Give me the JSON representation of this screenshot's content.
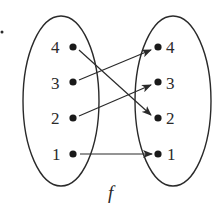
{
  "diagram": {
    "function_name": "f",
    "domain": {
      "elements": [
        {
          "label": "4",
          "x": 73,
          "y": 47
        },
        {
          "label": "3",
          "x": 73,
          "y": 82
        },
        {
          "label": "2",
          "x": 73,
          "y": 118
        },
        {
          "label": "1",
          "x": 73,
          "y": 154
        }
      ]
    },
    "codomain": {
      "elements": [
        {
          "label": "4",
          "x": 158,
          "y": 47
        },
        {
          "label": "3",
          "x": 158,
          "y": 82
        },
        {
          "label": "2",
          "x": 158,
          "y": 118
        },
        {
          "label": "1",
          "x": 158,
          "y": 154
        }
      ]
    },
    "mappings": [
      {
        "from": "4",
        "to": "2"
      },
      {
        "from": "3",
        "to": "4"
      },
      {
        "from": "2",
        "to": "3"
      },
      {
        "from": "1",
        "to": "1"
      }
    ],
    "colors": {
      "stroke": "#2a2a2a",
      "background": "#ffffff"
    }
  }
}
